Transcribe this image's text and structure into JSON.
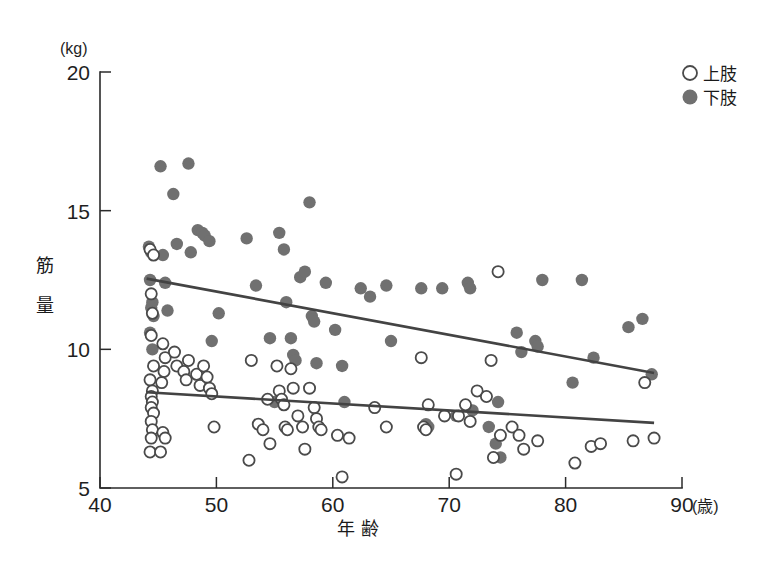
{
  "chart_data": {
    "type": "scatter",
    "title": "",
    "xlabel": "年 齢",
    "ylabel": "筋 量",
    "x_unit": "(歳)",
    "y_unit": "(kg)",
    "xlim": [
      40,
      90
    ],
    "ylim": [
      5,
      20
    ],
    "x_ticks": [
      40,
      50,
      60,
      70,
      80,
      90
    ],
    "y_ticks": [
      5,
      10,
      15,
      20
    ],
    "grid": false,
    "legend_position": "top-right",
    "colors": {
      "filled_marker": "#707070",
      "open_marker_stroke": "#4a4a4a",
      "fit_line": "#434343",
      "axis": "#2b2b2b"
    },
    "series": [
      {
        "name": "上肢",
        "marker": "open-circle",
        "points": [
          [
            44.3,
            13.6
          ],
          [
            44.6,
            13.4
          ],
          [
            44.4,
            12.0
          ],
          [
            44.5,
            11.3
          ],
          [
            44.4,
            10.5
          ],
          [
            44.6,
            9.4
          ],
          [
            44.3,
            8.9
          ],
          [
            44.5,
            8.5
          ],
          [
            44.4,
            8.3
          ],
          [
            44.5,
            8.1
          ],
          [
            44.4,
            7.9
          ],
          [
            44.6,
            7.7
          ],
          [
            44.4,
            7.4
          ],
          [
            44.5,
            7.1
          ],
          [
            44.4,
            6.8
          ],
          [
            44.3,
            6.3
          ],
          [
            45.2,
            6.3
          ],
          [
            45.4,
            10.2
          ],
          [
            45.6,
            9.7
          ],
          [
            45.5,
            9.2
          ],
          [
            45.3,
            8.8
          ],
          [
            45.4,
            7.0
          ],
          [
            45.6,
            6.8
          ],
          [
            46.4,
            9.9
          ],
          [
            46.6,
            9.4
          ],
          [
            47.2,
            9.2
          ],
          [
            47.4,
            8.9
          ],
          [
            47.6,
            9.6
          ],
          [
            48.3,
            9.1
          ],
          [
            48.6,
            8.7
          ],
          [
            48.9,
            9.4
          ],
          [
            49.2,
            9.0
          ],
          [
            49.4,
            8.6
          ],
          [
            49.6,
            8.4
          ],
          [
            49.8,
            7.2
          ],
          [
            52.8,
            6.0
          ],
          [
            53.0,
            9.6
          ],
          [
            53.6,
            7.3
          ],
          [
            54.0,
            7.1
          ],
          [
            54.4,
            8.2
          ],
          [
            54.6,
            6.6
          ],
          [
            55.2,
            9.4
          ],
          [
            55.4,
            8.5
          ],
          [
            55.6,
            8.2
          ],
          [
            55.8,
            8.0
          ],
          [
            55.9,
            7.2
          ],
          [
            56.1,
            7.1
          ],
          [
            56.4,
            9.3
          ],
          [
            56.6,
            8.6
          ],
          [
            57.0,
            7.6
          ],
          [
            57.4,
            7.2
          ],
          [
            57.6,
            6.4
          ],
          [
            58.0,
            8.6
          ],
          [
            58.4,
            7.9
          ],
          [
            58.6,
            7.5
          ],
          [
            58.8,
            7.2
          ],
          [
            59.0,
            7.1
          ],
          [
            60.4,
            6.9
          ],
          [
            60.8,
            5.4
          ],
          [
            61.4,
            6.8
          ],
          [
            63.6,
            7.9
          ],
          [
            64.6,
            7.2
          ],
          [
            67.6,
            9.7
          ],
          [
            67.8,
            7.2
          ],
          [
            68.0,
            7.1
          ],
          [
            68.2,
            8.0
          ],
          [
            69.6,
            7.6
          ],
          [
            70.6,
            5.5
          ],
          [
            70.8,
            7.6
          ],
          [
            71.4,
            8.0
          ],
          [
            71.8,
            7.4
          ],
          [
            72.4,
            8.5
          ],
          [
            73.2,
            8.3
          ],
          [
            73.6,
            9.6
          ],
          [
            73.8,
            6.1
          ],
          [
            74.2,
            12.8
          ],
          [
            74.4,
            6.9
          ],
          [
            75.4,
            7.2
          ],
          [
            76.0,
            6.9
          ],
          [
            76.4,
            6.4
          ],
          [
            77.6,
            6.7
          ],
          [
            80.8,
            5.9
          ],
          [
            82.2,
            6.5
          ],
          [
            83.0,
            6.6
          ],
          [
            85.8,
            6.7
          ],
          [
            86.8,
            8.8
          ],
          [
            87.6,
            6.8
          ]
        ]
      },
      {
        "name": "下肢",
        "marker": "filled-circle",
        "points": [
          [
            44.2,
            13.7
          ],
          [
            44.4,
            13.5
          ],
          [
            44.3,
            12.5
          ],
          [
            44.5,
            11.7
          ],
          [
            44.4,
            11.5
          ],
          [
            44.6,
            11.2
          ],
          [
            44.3,
            10.6
          ],
          [
            44.5,
            10.0
          ],
          [
            45.2,
            16.6
          ],
          [
            45.4,
            13.4
          ],
          [
            45.6,
            12.4
          ],
          [
            45.8,
            11.4
          ],
          [
            46.3,
            15.6
          ],
          [
            46.6,
            13.8
          ],
          [
            47.6,
            16.7
          ],
          [
            47.8,
            13.5
          ],
          [
            48.4,
            14.3
          ],
          [
            48.8,
            14.2
          ],
          [
            49.0,
            14.1
          ],
          [
            49.4,
            13.9
          ],
          [
            49.6,
            10.3
          ],
          [
            50.2,
            11.3
          ],
          [
            52.6,
            14.0
          ],
          [
            53.4,
            12.3
          ],
          [
            54.6,
            10.4
          ],
          [
            55.0,
            8.1
          ],
          [
            55.4,
            14.2
          ],
          [
            55.8,
            13.6
          ],
          [
            56.0,
            11.7
          ],
          [
            56.4,
            10.4
          ],
          [
            56.6,
            9.8
          ],
          [
            56.8,
            9.6
          ],
          [
            57.2,
            12.6
          ],
          [
            57.6,
            12.8
          ],
          [
            58.0,
            15.3
          ],
          [
            58.2,
            11.2
          ],
          [
            58.4,
            11.0
          ],
          [
            58.6,
            9.5
          ],
          [
            59.4,
            12.4
          ],
          [
            60.2,
            10.7
          ],
          [
            60.8,
            9.4
          ],
          [
            61.0,
            8.1
          ],
          [
            62.4,
            12.2
          ],
          [
            63.2,
            11.9
          ],
          [
            64.6,
            12.3
          ],
          [
            65.0,
            10.3
          ],
          [
            67.6,
            12.2
          ],
          [
            68.0,
            7.3
          ],
          [
            68.2,
            7.2
          ],
          [
            69.4,
            12.2
          ],
          [
            70.6,
            7.6
          ],
          [
            71.6,
            12.4
          ],
          [
            71.8,
            12.2
          ],
          [
            72.0,
            7.8
          ],
          [
            73.4,
            7.2
          ],
          [
            74.0,
            6.6
          ],
          [
            74.2,
            8.1
          ],
          [
            74.4,
            6.1
          ],
          [
            75.8,
            10.6
          ],
          [
            76.2,
            9.9
          ],
          [
            77.4,
            10.3
          ],
          [
            77.6,
            10.1
          ],
          [
            78.0,
            12.5
          ],
          [
            80.6,
            8.8
          ],
          [
            81.4,
            12.5
          ],
          [
            82.4,
            9.7
          ],
          [
            85.4,
            10.8
          ],
          [
            86.6,
            11.1
          ],
          [
            87.4,
            9.1
          ]
        ]
      }
    ],
    "fit_lines": [
      {
        "series": "下肢",
        "x_start": 44.0,
        "y_start": 12.55,
        "x_end": 87.6,
        "y_end": 9.15
      },
      {
        "series": "上肢",
        "x_start": 44.0,
        "y_start": 8.45,
        "x_end": 87.6,
        "y_end": 7.35
      }
    ]
  },
  "legend": {
    "items": [
      {
        "label": "上肢",
        "marker": "open-circle"
      },
      {
        "label": "下肢",
        "marker": "filled-circle"
      }
    ]
  },
  "axes": {
    "y_unit_label": "(kg)",
    "x_unit_label": "(歳)",
    "y_title_chars": [
      "筋",
      "量"
    ],
    "x_title": "年 齢",
    "x_tick_labels": [
      "40",
      "50",
      "60",
      "70",
      "80",
      "90"
    ],
    "y_tick_labels": [
      "20",
      "15",
      "10",
      "5"
    ]
  }
}
